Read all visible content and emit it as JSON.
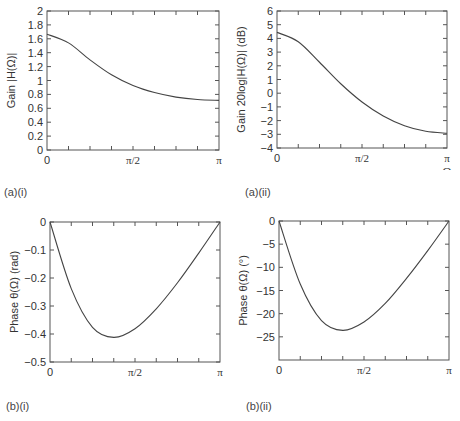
{
  "figure": {
    "captions": [
      "(a)(i)",
      "(a)(ii)",
      "(b)(i)",
      "(b)(ii)"
    ]
  },
  "chart_data": [
    {
      "id": "a-i",
      "type": "line",
      "caption": "(a)(i)",
      "title": "",
      "xlabel": "Ω",
      "ylabel": "Gain |H(Ω)|",
      "x_ticks": [
        "0",
        "π/2",
        "π"
      ],
      "y_ticks": [
        "0",
        "0.2",
        "0.4",
        "0.6",
        "0.8",
        "1",
        "1.2",
        "1.4",
        "1.6",
        "1.8",
        "2"
      ],
      "xlim": [
        0,
        3.14159
      ],
      "ylim": [
        0,
        2
      ],
      "grid": false,
      "x": [
        0,
        0.3927,
        0.7854,
        1.1781,
        1.5708,
        1.9635,
        2.3562,
        2.7489,
        3.1416
      ],
      "series": [
        {
          "name": "|H(Ω)|",
          "values": [
            1.667,
            1.541,
            1.297,
            1.082,
            0.928,
            0.826,
            0.761,
            0.726,
            0.714
          ]
        }
      ]
    },
    {
      "id": "a-ii",
      "type": "line",
      "caption": "(a)(ii)",
      "title": "",
      "xlabel": "Ω",
      "ylabel": "Gain 20log|H(Ω)| (dB)",
      "x_ticks": [
        "0",
        "π/2",
        "π"
      ],
      "y_ticks": [
        "-4",
        "-3",
        "-2",
        "-1",
        "0",
        "1",
        "2",
        "3",
        "4",
        "5",
        "6"
      ],
      "xlim": [
        0,
        3.14159
      ],
      "ylim": [
        -4,
        6
      ],
      "grid": false,
      "x": [
        0,
        0.3927,
        0.7854,
        1.1781,
        1.5708,
        1.9635,
        2.3562,
        2.7489,
        3.1416
      ],
      "series": [
        {
          "name": "20log|H(Ω)|",
          "values": [
            4.44,
            3.76,
            2.26,
            0.69,
            -0.64,
            -1.66,
            -2.37,
            -2.78,
            -2.92
          ]
        }
      ]
    },
    {
      "id": "b-i",
      "type": "line",
      "caption": "(b)(i)",
      "title": "",
      "xlabel": "Ω",
      "ylabel": "Phase θ(Ω) (rad)",
      "x_ticks": [
        "0",
        "π/2",
        "π"
      ],
      "y_ticks": [
        "-0.5",
        "-0.4",
        "-0.3",
        "-0.2",
        "-0.1",
        "0"
      ],
      "xlim": [
        0,
        3.14159
      ],
      "ylim": [
        -0.5,
        0
      ],
      "grid": false,
      "x": [
        0,
        0.3927,
        0.7854,
        1.1781,
        1.5708,
        1.9635,
        2.3562,
        2.7489,
        3.1416
      ],
      "series": [
        {
          "name": "θ(Ω) rad",
          "values": [
            0,
            -0.238,
            -0.376,
            -0.412,
            -0.381,
            -0.31,
            -0.217,
            -0.111,
            0
          ]
        }
      ]
    },
    {
      "id": "b-ii",
      "type": "line",
      "caption": "(b)(ii)",
      "title": "",
      "xlabel": "Ω",
      "ylabel": "Phase θ(Ω) (°)",
      "x_ticks": [
        "0",
        "π/2",
        "π"
      ],
      "y_ticks": [
        "-25",
        "-20",
        "-15",
        "-10",
        "-5",
        "0"
      ],
      "xlim": [
        0,
        3.14159
      ],
      "ylim": [
        -30,
        0
      ],
      "grid": false,
      "x": [
        0,
        0.3927,
        0.7854,
        1.1781,
        1.5708,
        1.9635,
        2.3562,
        2.7489,
        3.1416
      ],
      "series": [
        {
          "name": "θ(Ω) deg",
          "values": [
            0,
            -13.6,
            -21.5,
            -23.6,
            -21.8,
            -17.8,
            -12.4,
            -6.4,
            0
          ]
        }
      ]
    }
  ]
}
